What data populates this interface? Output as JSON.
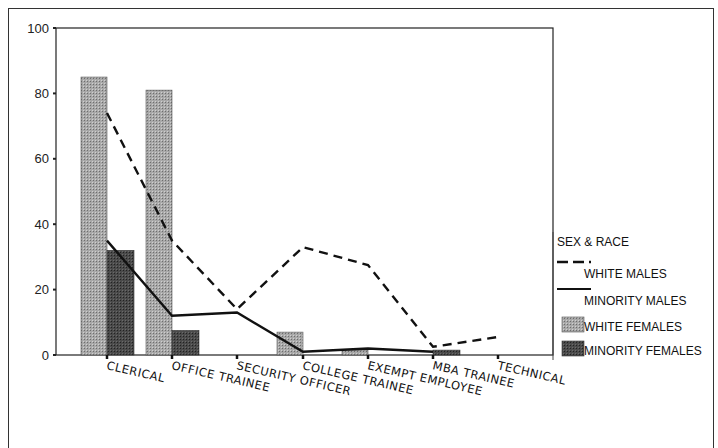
{
  "chart_data": {
    "type": "bar+line",
    "title": "",
    "xlabel": "",
    "ylabel": "",
    "ylim": [
      0,
      100
    ],
    "yticks": [
      0,
      20,
      40,
      60,
      80,
      100
    ],
    "grid": false,
    "legend_position": "right",
    "legend_title": "SEX & RACE",
    "categories": [
      "CLERICAL",
      "OFFICE TRAINEE",
      "SECURITY OFFICER",
      "COLLEGE TRAINEE",
      "EXEMPT EMPLOYEE",
      "MBA TRAINEE",
      "TECHNICAL"
    ],
    "series": [
      {
        "name": "WHITE MALES",
        "kind": "line",
        "style": "dashed",
        "values": [
          74,
          35,
          14,
          33,
          27.5,
          2.5,
          5.5
        ]
      },
      {
        "name": "MINORITY MALES",
        "kind": "line",
        "style": "solid",
        "values": [
          35,
          12,
          13,
          1,
          2,
          1,
          null
        ]
      },
      {
        "name": "WHITE FEMALES",
        "kind": "bar",
        "color": "#9a9a9a",
        "values": [
          85,
          81,
          0,
          7,
          1.5,
          0,
          0
        ]
      },
      {
        "name": "MINORITY FEMALES",
        "kind": "bar",
        "color": "#444444",
        "values": [
          32,
          7.5,
          0,
          0,
          0,
          1.5,
          0
        ]
      }
    ]
  }
}
